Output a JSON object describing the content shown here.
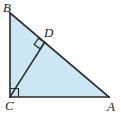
{
  "figure": {
    "type": "geometry-diagram",
    "fill_color": "#cbe7f3",
    "line_color": "#2b2b2b",
    "background_color": "#ffffff",
    "width": 121,
    "height": 118
  },
  "labels": {
    "B": "B",
    "D": "D",
    "C": "C",
    "A": "A"
  },
  "points": {
    "B": {
      "x": 10,
      "y": 13
    },
    "C": {
      "x": 10,
      "y": 97
    },
    "A": {
      "x": 109,
      "y": 97
    },
    "D": {
      "x": 44.5,
      "y": 42.5
    }
  },
  "segments": [
    {
      "name": "BC",
      "from": "B",
      "to": "C"
    },
    {
      "name": "CA",
      "from": "C",
      "to": "A"
    },
    {
      "name": "BA",
      "from": "B",
      "to": "A"
    },
    {
      "name": "CD",
      "from": "C",
      "to": "D"
    }
  ],
  "right_angles": [
    {
      "at": "C",
      "label": "right-angle-mark-C"
    },
    {
      "at": "D",
      "label": "right-angle-mark-D"
    }
  ],
  "paths": {
    "triangle": "M 10,13 L 10,97 L 109,97 Z",
    "altitude": "M 10,97 L 44.5,42.5",
    "right_angle_C": "M 10,88 L 19,88 L 19,97",
    "right_angle_D": "M 44.5,42.5 L 38.6,38.4 L 34.3,44.6 L 40.2,48.7 Z"
  }
}
